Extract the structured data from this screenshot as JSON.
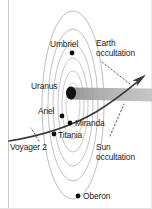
{
  "figure": {
    "name": "voyager-2-uranus-encounter-diagram",
    "background_color": "#ffffff",
    "frame_color": "#c9c9c9",
    "width": 152,
    "height": 209
  },
  "planet": {
    "label": "Uranus",
    "label_x": 31,
    "label_y": 82,
    "body_cx": 71,
    "body_cy": 93,
    "body_rx": 5.0,
    "body_ry": 6.4,
    "body_color": "#121212"
  },
  "rings": {
    "name": "uranus-ring-system",
    "center_x": 73,
    "center_y": 105,
    "color": "#bdbdbd",
    "ellipses": [
      {
        "rx": 7,
        "ry": 22
      },
      {
        "rx": 11,
        "ry": 34
      },
      {
        "rx": 15,
        "ry": 47
      },
      {
        "rx": 20,
        "ry": 61
      },
      {
        "rx": 25,
        "ry": 76
      },
      {
        "rx": 31,
        "ry": 94
      }
    ]
  },
  "shadow_cone": {
    "name": "planet-shadow-cone",
    "color": "#a8a8a8",
    "label": ""
  },
  "trajectory": {
    "name": "voyager-2-trajectory",
    "color": "#333333",
    "label": "Voyager 2",
    "label_x": 10,
    "label_y": 143
  },
  "moons": [
    {
      "name": "Umbriel",
      "dot_x": 72,
      "dot_y": 53,
      "label_x": 50,
      "label_y": 40,
      "align": "left"
    },
    {
      "name": "Ariel",
      "dot_x": 62,
      "dot_y": 116,
      "label_x": 38,
      "label_y": 107,
      "align": "left"
    },
    {
      "name": "Miranda",
      "dot_x": 70,
      "dot_y": 123,
      "label_x": 75,
      "label_y": 119,
      "align": "left"
    },
    {
      "name": "Titania",
      "dot_x": 54,
      "dot_y": 134,
      "label_x": 58,
      "label_y": 131,
      "align": "left"
    },
    {
      "name": "Oberon",
      "dot_x": 78,
      "dot_y": 196,
      "label_x": 83,
      "label_y": 192,
      "align": "left"
    }
  ],
  "annotations": [
    {
      "name": "earth-occultation",
      "line1": "Earth",
      "line2": "occultation",
      "label_x": 96,
      "label_y": 39,
      "leader": {
        "x1": 102,
        "y1": 62,
        "x2": 130,
        "y2": 84
      }
    },
    {
      "name": "sun-occultation",
      "line1": "Sun",
      "line2": "occultation",
      "label_x": 96,
      "label_y": 143,
      "leader": {
        "x1": 110,
        "y1": 136,
        "x2": 124,
        "y2": 104
      }
    }
  ],
  "dot_color": "#0d0d0d",
  "dot_radius": 2.4
}
